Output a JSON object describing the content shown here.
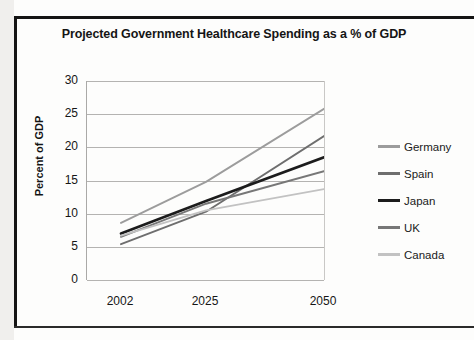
{
  "chart_data": {
    "type": "line",
    "title": "Projected Government Healthcare Spending as a % of GDP",
    "xlabel": "",
    "ylabel": "Percent of GDP",
    "categories": [
      "2002",
      "2025",
      "2050"
    ],
    "x": [
      2002,
      2025,
      2050
    ],
    "ylim": [
      0,
      30
    ],
    "yticks": [
      0,
      5,
      10,
      15,
      20,
      25,
      30
    ],
    "ytick_labels": [
      "0",
      "5",
      "10",
      "15",
      "20",
      "25",
      "30"
    ],
    "grid": "horizontal",
    "legend_position": "right",
    "series": [
      {
        "name": "Germany",
        "values": [
          8.6,
          14.8,
          25.8
        ],
        "color": "#9c9c9c"
      },
      {
        "name": "Spain",
        "values": [
          5.4,
          10.3,
          21.7
        ],
        "color": "#6e6e6e"
      },
      {
        "name": "Japan",
        "values": [
          7.0,
          11.9,
          18.5
        ],
        "color": "#1c1c1c"
      },
      {
        "name": "UK",
        "values": [
          6.5,
          11.5,
          16.4
        ],
        "color": "#777777"
      },
      {
        "name": "Canada",
        "values": [
          6.7,
          10.5,
          13.7
        ],
        "color": "#c2c2c2"
      }
    ]
  },
  "legend": {
    "items": [
      {
        "label": "Germany"
      },
      {
        "label": "Spain"
      },
      {
        "label": "Japan"
      },
      {
        "label": "UK"
      },
      {
        "label": "Canada"
      }
    ]
  }
}
